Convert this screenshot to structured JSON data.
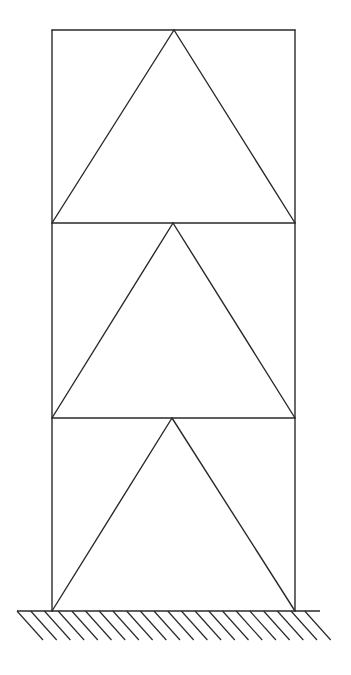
{
  "diagram": {
    "type": "braced-frame",
    "stroke_color": "#2a2a2a",
    "background_color": "#ffffff",
    "frame": {
      "left_x": 52,
      "right_x": 295,
      "levels_y": [
        30,
        223,
        418,
        611
      ]
    },
    "stories": [
      {
        "name": "story-3",
        "top_y": 30,
        "bottom_y": 223,
        "apex_x": 174
      },
      {
        "name": "story-2",
        "top_y": 223,
        "bottom_y": 418,
        "apex_x": 173
      },
      {
        "name": "story-1",
        "top_y": 418,
        "bottom_y": 611,
        "apex_x": 172
      }
    ],
    "ground": {
      "y": 611,
      "x_start": 17,
      "x_end": 320,
      "hatch_count": 22,
      "hatch_spacing": 13.7,
      "hatch_dx": 26,
      "hatch_dy": 29
    }
  }
}
